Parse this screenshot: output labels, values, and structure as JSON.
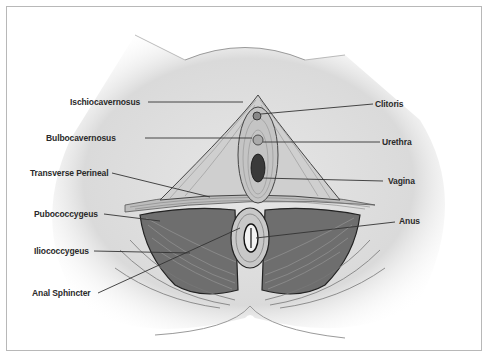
{
  "diagram": {
    "colors": {
      "frame_border": "#b8b8b8",
      "skin": "#d9d9d9",
      "muscle_dark": "#555555",
      "label_text": "#2a2a2a",
      "leader_line": "#333333"
    },
    "labels_left": [
      {
        "id": "ischiocavernosus",
        "text": "Ischiocavernosus"
      },
      {
        "id": "bulbocavernosus",
        "text": "Bulbocavernosus"
      },
      {
        "id": "transverse-perineal",
        "text": "Transverse Perineal"
      },
      {
        "id": "pubococcygeus",
        "text": "Pubococcygeus"
      },
      {
        "id": "iliococcygeus",
        "text": "Iliococcygeus"
      },
      {
        "id": "anal-sphincter",
        "text": "Anal Sphincter"
      }
    ],
    "labels_right": [
      {
        "id": "clitoris",
        "text": "Clitoris"
      },
      {
        "id": "urethra",
        "text": "Urethra"
      },
      {
        "id": "vagina",
        "text": "Vagina"
      },
      {
        "id": "anus",
        "text": "Anus"
      }
    ]
  }
}
